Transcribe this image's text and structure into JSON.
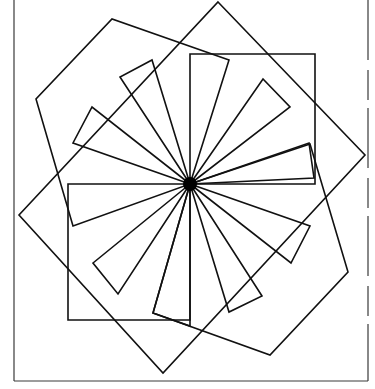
{
  "diagram": {
    "title": "",
    "colors": {
      "stroke": "#111111",
      "background": "#ffffff",
      "frame": "#3a3a3a"
    },
    "center": [
      190,
      184
    ],
    "frame": {
      "left": 14,
      "bottom": 381,
      "right": 368,
      "top": 0
    },
    "polygons": [
      {
        "name": "axis-rect-top-right",
        "points": [
          [
            190,
            54
          ],
          [
            315,
            54
          ],
          [
            315,
            184
          ],
          [
            190,
            184
          ]
        ]
      },
      {
        "name": "axis-rect-bottom-left",
        "points": [
          [
            68,
            184
          ],
          [
            190,
            184
          ],
          [
            190,
            320
          ],
          [
            68,
            320
          ]
        ]
      },
      {
        "name": "outer-square-a",
        "points": [
          [
            218,
            2
          ],
          [
            365,
            155
          ],
          [
            163,
            373
          ],
          [
            19,
            215
          ]
        ]
      },
      {
        "name": "outer-square-b",
        "points": [
          [
            190,
            184
          ],
          [
            229,
            60
          ],
          [
            112,
            19
          ],
          [
            36,
            99
          ],
          [
            73,
            226
          ]
        ]
      },
      {
        "name": "outer-square-c",
        "points": [
          [
            190,
            184
          ],
          [
            310,
            144
          ],
          [
            348,
            272
          ],
          [
            270,
            355
          ],
          [
            153,
            313
          ]
        ]
      },
      {
        "name": "blade-nnw",
        "points": [
          [
            190,
            184
          ],
          [
            152,
            60
          ],
          [
            120,
            77
          ]
        ]
      },
      {
        "name": "blade-nw",
        "points": [
          [
            190,
            184
          ],
          [
            92,
            107
          ],
          [
            73,
            143
          ]
        ]
      },
      {
        "name": "blade-ne",
        "points": [
          [
            190,
            184
          ],
          [
            263,
            79
          ],
          [
            290,
            107
          ]
        ]
      },
      {
        "name": "blade-ene",
        "points": [
          [
            190,
            184
          ],
          [
            309,
            143
          ],
          [
            314,
            178
          ]
        ]
      },
      {
        "name": "blade-ese",
        "points": [
          [
            190,
            184
          ],
          [
            310,
            226
          ],
          [
            291,
            263
          ]
        ]
      },
      {
        "name": "blade-sse",
        "points": [
          [
            190,
            184
          ],
          [
            262,
            296
          ],
          [
            229,
            312
          ]
        ]
      },
      {
        "name": "blade-ssw",
        "points": [
          [
            190,
            184
          ],
          [
            118,
            294
          ],
          [
            93,
            263
          ]
        ]
      },
      {
        "name": "blade-wsw",
        "points": [
          [
            190,
            184
          ],
          [
            153,
            313
          ],
          [
            190,
            326
          ]
        ]
      }
    ],
    "hub_radius": 7
  }
}
